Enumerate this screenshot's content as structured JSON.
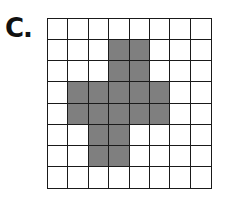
{
  "label": "C.",
  "grid": {
    "rows": 8,
    "cols": 8,
    "shaded_color": "#7f7f7f",
    "empty_color": "#ffffff",
    "line_color": "#1a1a1a",
    "shaded_cells": [
      [
        1,
        3
      ],
      [
        1,
        4
      ],
      [
        2,
        3
      ],
      [
        2,
        4
      ],
      [
        3,
        1
      ],
      [
        3,
        2
      ],
      [
        3,
        3
      ],
      [
        3,
        4
      ],
      [
        3,
        5
      ],
      [
        4,
        1
      ],
      [
        4,
        2
      ],
      [
        4,
        3
      ],
      [
        4,
        4
      ],
      [
        4,
        5
      ],
      [
        5,
        2
      ],
      [
        5,
        3
      ],
      [
        6,
        2
      ],
      [
        6,
        3
      ]
    ],
    "shaded_count": 18
  }
}
